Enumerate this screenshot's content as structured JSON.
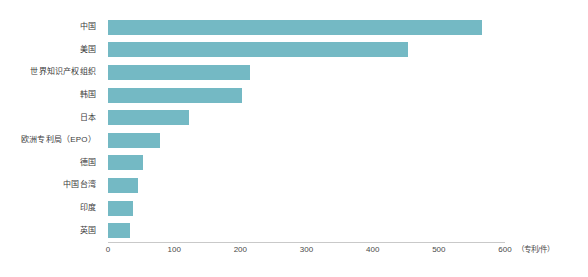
{
  "chart_data": {
    "type": "bar",
    "orientation": "horizontal",
    "title": "",
    "xlabel": "",
    "ylabel": "",
    "unit_label": "（专利/件）",
    "xlim": [
      0,
      600
    ],
    "xticks": [
      0,
      100,
      200,
      300,
      400,
      500,
      600
    ],
    "xtick_labels": [
      "0",
      "100",
      "200",
      "300",
      "400",
      "500",
      "600"
    ],
    "grid": false,
    "legend": "none",
    "bar_color": "#74b9c4",
    "axis_color": "#c9c9c9",
    "text_color": "#3b3b3b",
    "background": "#ffffff",
    "categories": [
      "中国",
      "美国",
      "世界知识产权组织",
      "韩国",
      "日本",
      "欧洲专利局（EPO）",
      "德国",
      "中国台湾",
      "印度",
      "英国"
    ],
    "values": [
      565,
      453,
      215,
      203,
      123,
      78,
      53,
      46,
      38,
      33
    ]
  }
}
